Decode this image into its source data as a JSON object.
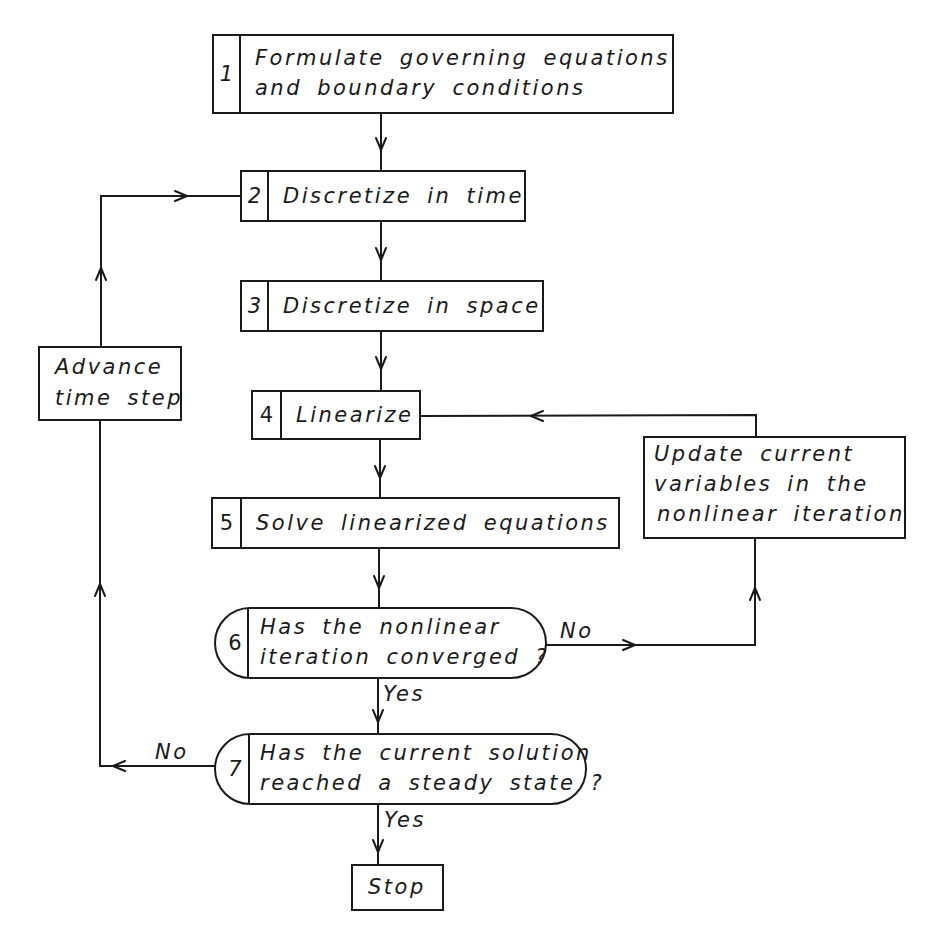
{
  "diagram": {
    "type": "flowchart",
    "steps": [
      {
        "id": "1",
        "number": "1",
        "lines": [
          "Formulate governing equations",
          "and boundary conditions"
        ],
        "shape": "numbered-rectangle"
      },
      {
        "id": "2",
        "number": "2",
        "lines": [
          "Discretize in time"
        ],
        "shape": "numbered-rectangle"
      },
      {
        "id": "3",
        "number": "3",
        "lines": [
          "Discretize in space"
        ],
        "shape": "numbered-rectangle"
      },
      {
        "id": "4",
        "number": "4",
        "lines": [
          "Linearize"
        ],
        "shape": "numbered-rectangle"
      },
      {
        "id": "5",
        "number": "5",
        "lines": [
          "Solve linearized equations"
        ],
        "shape": "numbered-rectangle"
      },
      {
        "id": "6",
        "number": "6",
        "lines": [
          "Has the nonlinear",
          "iteration converged ?"
        ],
        "shape": "numbered-decision"
      },
      {
        "id": "7",
        "number": "7",
        "lines": [
          "Has the current solution",
          "reached a steady state ?"
        ],
        "shape": "numbered-decision"
      }
    ],
    "side_boxes": {
      "advance": {
        "lines": [
          "Advance",
          "time step"
        ]
      },
      "update": {
        "lines": [
          "Update current",
          "variables in the",
          "nonlinear iteration"
        ]
      },
      "stop": {
        "lines": [
          "Stop"
        ]
      }
    },
    "edge_labels": {
      "step6_no": "No",
      "step6_yes": "Yes",
      "step7_no": "No",
      "step7_yes": "Yes"
    },
    "edges": [
      {
        "from": "1",
        "to": "2"
      },
      {
        "from": "2",
        "to": "3"
      },
      {
        "from": "3",
        "to": "4"
      },
      {
        "from": "4",
        "to": "5"
      },
      {
        "from": "5",
        "to": "6"
      },
      {
        "from": "6",
        "to": "7",
        "label": "Yes"
      },
      {
        "from": "6",
        "to": "update",
        "label": "No"
      },
      {
        "from": "update",
        "to": "4"
      },
      {
        "from": "7",
        "to": "stop",
        "label": "Yes"
      },
      {
        "from": "7",
        "to": "advance",
        "label": "No"
      },
      {
        "from": "advance",
        "to": "2"
      }
    ],
    "colors": {
      "ink": "#1a1a1a",
      "paper": "#ffffff"
    }
  }
}
